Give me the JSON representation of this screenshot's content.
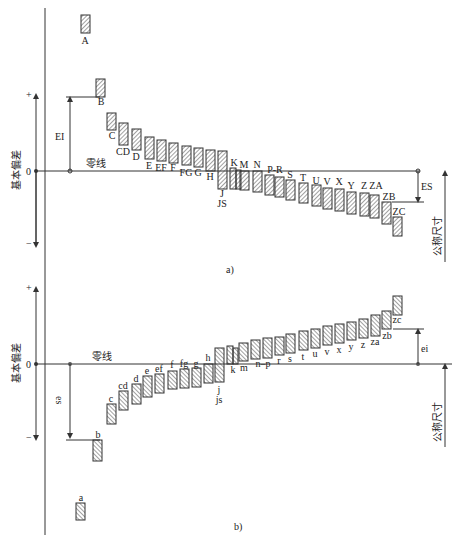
{
  "colors": {
    "line": "#333333",
    "hatch": "#444444",
    "bg": "#ffffff"
  },
  "axis": {
    "plus": "+",
    "minus": "−",
    "zero": "0",
    "ylabel": "基本偏差",
    "zero_line_label": "零线",
    "nominal_size_label": "公称尺寸"
  },
  "diagram_a": {
    "caption": "a)",
    "zero_y": 171,
    "upper_arrow_label": "EI",
    "right_arrow_label": "ES",
    "bars": [
      {
        "label": "A",
        "x": 81,
        "top": 15,
        "bottom": 33,
        "lx": 85,
        "ly": 44
      },
      {
        "label": "B",
        "x": 96,
        "top": 79,
        "bottom": 97,
        "lx": 101,
        "ly": 105
      },
      {
        "label": "C",
        "x": 107,
        "top": 113,
        "bottom": 130,
        "lx": 112,
        "ly": 139
      },
      {
        "label": "CD",
        "x": 119,
        "top": 123,
        "bottom": 145,
        "lx": 123,
        "ly": 155
      },
      {
        "label": "D",
        "x": 132,
        "top": 129,
        "bottom": 150,
        "lx": 136,
        "ly": 160
      },
      {
        "label": "E",
        "x": 145,
        "top": 137,
        "bottom": 159,
        "lx": 149,
        "ly": 169
      },
      {
        "label": "EF",
        "x": 157,
        "top": 140,
        "bottom": 161,
        "lx": 161,
        "ly": 171
      },
      {
        "label": "F",
        "x": 169,
        "top": 143,
        "bottom": 163,
        "lx": 173,
        "ly": 171
      },
      {
        "label": "FG",
        "x": 182,
        "top": 146,
        "bottom": 165,
        "lx": 186,
        "ly": 176
      },
      {
        "label": "G",
        "x": 194,
        "top": 148,
        "bottom": 167,
        "lx": 198,
        "ly": 176
      },
      {
        "label": "H",
        "x": 206,
        "top": 150,
        "bottom": 171,
        "lx": 210,
        "ly": 180
      },
      {
        "label": "J",
        "x": 218,
        "top": 151,
        "bottom": 189,
        "lx": 222,
        "ly": 197
      },
      {
        "label": "JS",
        "x": 0,
        "top": 0,
        "bottom": 0,
        "lx": 222,
        "ly": 207,
        "text_only": true
      },
      {
        "label": "K",
        "x": 230,
        "top": 168,
        "bottom": 189,
        "lx": 234,
        "ly": 166,
        "narrow": true
      },
      {
        "label": "M",
        "x": 240,
        "top": 171,
        "bottom": 190,
        "lx": 244,
        "ly": 168
      },
      {
        "label": "N",
        "x": 253,
        "top": 171,
        "bottom": 192,
        "lx": 257,
        "ly": 168
      },
      {
        "label": "P-R",
        "x": 265,
        "top": 175,
        "bottom": 195,
        "lx": 275,
        "ly": 173,
        "dual": true,
        "x2": 275,
        "top2": 177,
        "bottom2": 197
      },
      {
        "label": "S",
        "x": 286,
        "top": 180,
        "bottom": 200,
        "lx": 290,
        "ly": 178
      },
      {
        "label": "T",
        "x": 299,
        "top": 183,
        "bottom": 203,
        "lx": 303,
        "ly": 181
      },
      {
        "label": "U",
        "x": 312,
        "top": 185,
        "bottom": 206,
        "lx": 316,
        "ly": 184
      },
      {
        "label": "V",
        "x": 323,
        "top": 188,
        "bottom": 209,
        "lx": 327,
        "ly": 185
      },
      {
        "label": "X",
        "x": 335,
        "top": 189,
        "bottom": 211,
        "lx": 339,
        "ly": 185
      },
      {
        "label": "Y",
        "x": 347,
        "top": 192,
        "bottom": 214,
        "lx": 351,
        "ly": 189
      },
      {
        "label": "Z",
        "x": 360,
        "top": 193,
        "bottom": 216,
        "lx": 364,
        "ly": 189
      },
      {
        "label": "ZA",
        "x": 370,
        "top": 195,
        "bottom": 218,
        "lx": 376,
        "ly": 189
      },
      {
        "label": "ZB",
        "x": 382,
        "top": 202,
        "bottom": 224,
        "lx": 389,
        "ly": 200
      },
      {
        "label": "ZC",
        "x": 393,
        "top": 217,
        "bottom": 236,
        "lx": 399,
        "ly": 215
      }
    ]
  },
  "diagram_b": {
    "caption": "b)",
    "zero_y": 364,
    "lower_arrow_label": "es",
    "right_arrow_label": "ei",
    "bars": [
      {
        "label": "a",
        "x": 76,
        "top": 503,
        "bottom": 520,
        "lx": 81,
        "ly": 501
      },
      {
        "label": "b",
        "x": 93,
        "top": 440,
        "bottom": 461,
        "lx": 98,
        "ly": 438
      },
      {
        "label": "c",
        "x": 107,
        "top": 404,
        "bottom": 424,
        "lx": 111,
        "ly": 402
      },
      {
        "label": "cd",
        "x": 119,
        "top": 391,
        "bottom": 410,
        "lx": 123,
        "ly": 389
      },
      {
        "label": "d",
        "x": 132,
        "top": 384,
        "bottom": 404,
        "lx": 136,
        "ly": 382
      },
      {
        "label": "e",
        "x": 143,
        "top": 376,
        "bottom": 397,
        "lx": 147,
        "ly": 374
      },
      {
        "label": "ef",
        "x": 155,
        "top": 374,
        "bottom": 393,
        "lx": 159,
        "ly": 372
      },
      {
        "label": "f",
        "x": 168,
        "top": 371,
        "bottom": 389,
        "lx": 172,
        "ly": 368
      },
      {
        "label": "fg",
        "x": 180,
        "top": 369,
        "bottom": 388,
        "lx": 184,
        "ly": 367
      },
      {
        "label": "g",
        "x": 192,
        "top": 368,
        "bottom": 387,
        "lx": 196,
        "ly": 367
      },
      {
        "label": "h",
        "x": 204,
        "top": 364,
        "bottom": 383,
        "lx": 208,
        "ly": 361
      },
      {
        "label": "j",
        "x": 215,
        "top": 348,
        "bottom": 382,
        "lx": 219,
        "ly": 393
      },
      {
        "label": "js",
        "x": 0,
        "top": 0,
        "bottom": 0,
        "lx": 219,
        "ly": 403,
        "text_only": true
      },
      {
        "label": "k",
        "x": 227,
        "top": 346,
        "bottom": 364,
        "lx": 233,
        "ly": 373,
        "narrow": true
      },
      {
        "label": "m",
        "x": 239,
        "top": 343,
        "bottom": 361,
        "lx": 244,
        "ly": 371
      },
      {
        "label": "n–p",
        "x": 251,
        "top": 340,
        "bottom": 359,
        "lx": 263,
        "ly": 367,
        "dual": true,
        "x2": 263,
        "top2": 338,
        "bottom2": 358
      },
      {
        "label": "r",
        "x": 275,
        "top": 337,
        "bottom": 355,
        "lx": 279,
        "ly": 364
      },
      {
        "label": "s",
        "x": 286,
        "top": 334,
        "bottom": 353,
        "lx": 290,
        "ly": 362
      },
      {
        "label": "t",
        "x": 299,
        "top": 331,
        "bottom": 350,
        "lx": 303,
        "ly": 360
      },
      {
        "label": "u",
        "x": 311,
        "top": 329,
        "bottom": 348,
        "lx": 315,
        "ly": 357
      },
      {
        "label": "v",
        "x": 323,
        "top": 326,
        "bottom": 345,
        "lx": 327,
        "ly": 355
      },
      {
        "label": "x",
        "x": 335,
        "top": 324,
        "bottom": 343,
        "lx": 339,
        "ly": 353
      },
      {
        "label": "y",
        "x": 347,
        "top": 322,
        "bottom": 340,
        "lx": 351,
        "ly": 350
      },
      {
        "label": "z",
        "x": 359,
        "top": 319,
        "bottom": 338,
        "lx": 363,
        "ly": 348
      },
      {
        "label": "za",
        "x": 371,
        "top": 315,
        "bottom": 336,
        "lx": 375,
        "ly": 345
      },
      {
        "label": "zb",
        "x": 382,
        "top": 311,
        "bottom": 329,
        "lx": 387,
        "ly": 339
      },
      {
        "label": "zc",
        "x": 393,
        "top": 296,
        "bottom": 315,
        "lx": 397,
        "ly": 323
      }
    ]
  }
}
